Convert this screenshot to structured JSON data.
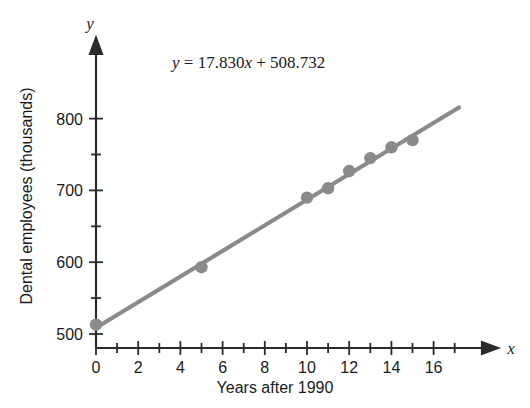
{
  "chart_data": {
    "type": "scatter",
    "title": "",
    "xlabel": "Years after 1990",
    "ylabel": "Dental employees (thousands)",
    "x_axis_variable": "x",
    "y_axis_variable": "y",
    "annotation": "y = 17.830x + 508.732",
    "annotation_parts": {
      "y": "y",
      "equals": "=",
      "slope": "17.830",
      "x": "x",
      "plus": "+",
      "intercept": "508.732"
    },
    "grid": false,
    "legend": "none",
    "xlim": [
      0,
      17.5
    ],
    "ylim": [
      490,
      845
    ],
    "x_ticks_major": [
      0,
      2,
      4,
      6,
      8,
      10,
      12,
      14,
      16
    ],
    "x_tick_labels": [
      "0",
      "2",
      "4",
      "6",
      "8",
      "10",
      "12",
      "14",
      "16"
    ],
    "x_ticks_minor": [
      1,
      3,
      5,
      7,
      9,
      11,
      13,
      15,
      17
    ],
    "y_ticks_major": [
      500,
      600,
      700,
      800
    ],
    "y_tick_labels": [
      "500",
      "600",
      "700",
      "800"
    ],
    "y_ticks_minor": [
      550,
      650,
      750
    ],
    "x": [
      0,
      5,
      10,
      11,
      12,
      13,
      14,
      15
    ],
    "values": [
      513,
      593,
      690,
      703,
      727,
      745,
      760,
      770
    ],
    "points": [
      {
        "x": 0,
        "y": 513
      },
      {
        "x": 5,
        "y": 593
      },
      {
        "x": 10,
        "y": 690
      },
      {
        "x": 11,
        "y": 703
      },
      {
        "x": 12,
        "y": 727
      },
      {
        "x": 13,
        "y": 745
      },
      {
        "x": 14,
        "y": 760
      },
      {
        "x": 15,
        "y": 770
      }
    ],
    "fit_line": {
      "slope": 17.83,
      "intercept": 508.732,
      "x_start": 0,
      "x_end": 17.2
    },
    "colors": {
      "marker": "#8a8a8a",
      "line": "#8a8a8a",
      "axis": "#2b2b2b",
      "text": "#1a1a1a",
      "background": "#ffffff"
    }
  }
}
